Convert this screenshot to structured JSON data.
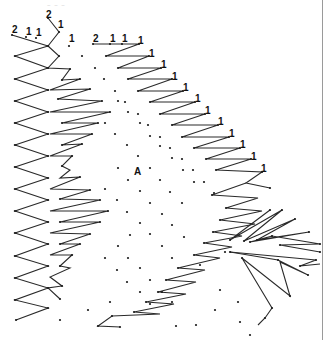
{
  "diagram": {
    "type": "lace-pricking",
    "faint_header": "~ ~ ~",
    "center_label": "A",
    "colors": {
      "line": "#2a2a2a",
      "dot": "#1a1a1a",
      "label": "#111111",
      "border": "#9a9a9a"
    },
    "labels": [
      {
        "text": "2",
        "x": 12,
        "y": 33
      },
      {
        "text": "1",
        "x": 26,
        "y": 35
      },
      {
        "text": "1",
        "x": 36,
        "y": 36
      },
      {
        "text": "2",
        "x": 46,
        "y": 18
      },
      {
        "text": "1",
        "x": 58,
        "y": 28
      },
      {
        "text": "1",
        "x": 69,
        "y": 42
      },
      {
        "text": "2",
        "x": 93,
        "y": 42
      },
      {
        "text": "1",
        "x": 110,
        "y": 42
      },
      {
        "text": "1",
        "x": 122,
        "y": 42
      },
      {
        "text": "1",
        "x": 138,
        "y": 44
      },
      {
        "text": "1",
        "x": 149,
        "y": 57
      },
      {
        "text": "1",
        "x": 161,
        "y": 68
      },
      {
        "text": "1",
        "x": 172,
        "y": 80
      },
      {
        "text": "1",
        "x": 183,
        "y": 91
      },
      {
        "text": "1",
        "x": 195,
        "y": 102
      },
      {
        "text": "1",
        "x": 205,
        "y": 114
      },
      {
        "text": "1",
        "x": 218,
        "y": 125
      },
      {
        "text": "1",
        "x": 229,
        "y": 137
      },
      {
        "text": "1",
        "x": 240,
        "y": 148
      },
      {
        "text": "1",
        "x": 251,
        "y": 160
      },
      {
        "text": "1",
        "x": 261,
        "y": 172
      }
    ],
    "polylines": [
      [
        [
          12,
          35
        ],
        [
          48,
          46
        ],
        [
          15,
          56
        ],
        [
          48,
          68
        ],
        [
          15,
          79
        ],
        [
          48,
          90
        ],
        [
          15,
          101
        ],
        [
          48,
          112
        ],
        [
          15,
          123
        ],
        [
          48,
          134
        ],
        [
          15,
          145
        ],
        [
          48,
          156
        ],
        [
          15,
          167
        ],
        [
          48,
          178
        ],
        [
          15,
          189
        ],
        [
          48,
          200
        ],
        [
          15,
          211
        ],
        [
          48,
          222
        ],
        [
          15,
          233
        ],
        [
          48,
          244
        ],
        [
          15,
          256
        ],
        [
          48,
          266
        ],
        [
          15,
          278
        ],
        [
          48,
          288
        ],
        [
          15,
          300
        ],
        [
          48,
          308
        ],
        [
          16,
          320
        ]
      ],
      [
        [
          48,
          46
        ],
        [
          59,
          32
        ],
        [
          48,
          18
        ]
      ],
      [
        [
          48,
          46
        ],
        [
          59,
          56
        ],
        [
          48,
          68
        ],
        [
          70,
          69
        ],
        [
          62,
          80
        ],
        [
          80,
          79
        ],
        [
          50,
          90
        ],
        [
          90,
          89
        ],
        [
          58,
          99
        ],
        [
          102,
          101
        ],
        [
          50,
          112
        ],
        [
          110,
          112
        ],
        [
          62,
          123
        ],
        [
          98,
          123
        ],
        [
          50,
          134
        ],
        [
          92,
          134
        ],
        [
          62,
          145
        ],
        [
          82,
          144
        ],
        [
          50,
          156
        ],
        [
          72,
          156
        ],
        [
          62,
          166
        ],
        [
          70,
          170
        ],
        [
          60,
          178
        ],
        [
          80,
          177
        ],
        [
          50,
          189
        ],
        [
          90,
          190
        ],
        [
          60,
          199
        ],
        [
          100,
          200
        ],
        [
          50,
          211
        ],
        [
          108,
          211
        ],
        [
          60,
          222
        ],
        [
          100,
          222
        ],
        [
          50,
          233
        ],
        [
          90,
          234
        ],
        [
          60,
          244
        ],
        [
          80,
          244
        ],
        [
          50,
          255
        ],
        [
          72,
          255
        ],
        [
          60,
          266
        ],
        [
          70,
          268
        ],
        [
          50,
          277
        ],
        [
          62,
          286
        ],
        [
          48,
          288
        ],
        [
          60,
          299
        ]
      ],
      [
        [
          93,
          44
        ],
        [
          139,
          44
        ],
        [
          106,
          56
        ],
        [
          149,
          56
        ],
        [
          118,
          68
        ],
        [
          161,
          68
        ],
        [
          128,
          79
        ],
        [
          172,
          79
        ],
        [
          138,
          91
        ],
        [
          183,
          91
        ],
        [
          150,
          102
        ],
        [
          195,
          102
        ],
        [
          160,
          114
        ],
        [
          205,
          114
        ],
        [
          172,
          125
        ],
        [
          218,
          125
        ],
        [
          182,
          137
        ],
        [
          229,
          137
        ],
        [
          194,
          148
        ],
        [
          240,
          148
        ],
        [
          206,
          159
        ],
        [
          251,
          159
        ],
        [
          216,
          170
        ],
        [
          262,
          172
        ],
        [
          246,
          183
        ],
        [
          270,
          188
        ]
      ],
      [
        [
          246,
          183
        ],
        [
          212,
          195
        ],
        [
          258,
          198
        ],
        [
          226,
          208
        ],
        [
          262,
          211
        ],
        [
          220,
          220
        ],
        [
          255,
          224
        ],
        [
          213,
          232
        ],
        [
          242,
          236
        ],
        [
          204,
          243
        ],
        [
          232,
          247
        ],
        [
          194,
          255
        ],
        [
          220,
          258
        ],
        [
          178,
          268
        ],
        [
          205,
          270
        ],
        [
          166,
          280
        ],
        [
          196,
          282
        ],
        [
          158,
          292
        ],
        [
          186,
          294
        ],
        [
          146,
          302
        ],
        [
          174,
          304
        ],
        [
          134,
          312
        ],
        [
          160,
          314
        ],
        [
          112,
          316
        ],
        [
          98,
          326
        ],
        [
          120,
          327
        ]
      ],
      [
        [
          270,
          210
        ],
        [
          230,
          240
        ],
        [
          282,
          210
        ],
        [
          244,
          241
        ],
        [
          295,
          219
        ],
        [
          257,
          240
        ],
        [
          309,
          232
        ],
        [
          250,
          242
        ],
        [
          272,
          236
        ],
        [
          320,
          244
        ],
        [
          280,
          245
        ],
        [
          320,
          252
        ]
      ],
      [
        [
          230,
          252
        ],
        [
          278,
          260
        ],
        [
          308,
          275
        ],
        [
          280,
          262
        ],
        [
          290,
          296
        ],
        [
          242,
          258
        ],
        [
          272,
          308
        ],
        [
          265,
          318
        ],
        [
          258,
          325
        ]
      ],
      [
        [
          230,
          252
        ],
        [
          316,
          260
        ],
        [
          300,
          266
        ],
        [
          320,
          264
        ]
      ]
    ],
    "dots": [
      [
        12,
        35
      ],
      [
        26,
        37
      ],
      [
        36,
        38
      ],
      [
        48,
        18
      ],
      [
        59,
        32
      ],
      [
        69,
        46
      ],
      [
        48,
        46
      ],
      [
        15,
        56
      ],
      [
        48,
        68
      ],
      [
        15,
        79
      ],
      [
        48,
        90
      ],
      [
        15,
        101
      ],
      [
        48,
        112
      ],
      [
        15,
        123
      ],
      [
        48,
        134
      ],
      [
        15,
        145
      ],
      [
        48,
        156
      ],
      [
        15,
        167
      ],
      [
        48,
        178
      ],
      [
        15,
        189
      ],
      [
        48,
        200
      ],
      [
        15,
        211
      ],
      [
        48,
        222
      ],
      [
        15,
        233
      ],
      [
        48,
        244
      ],
      [
        15,
        256
      ],
      [
        48,
        266
      ],
      [
        15,
        278
      ],
      [
        48,
        288
      ],
      [
        15,
        300
      ],
      [
        48,
        308
      ],
      [
        16,
        320
      ],
      [
        60,
        320
      ],
      [
        59,
        56
      ],
      [
        70,
        69
      ],
      [
        62,
        80
      ],
      [
        80,
        79
      ],
      [
        90,
        89
      ],
      [
        58,
        99
      ],
      [
        102,
        101
      ],
      [
        110,
        112
      ],
      [
        62,
        123
      ],
      [
        98,
        123
      ],
      [
        92,
        134
      ],
      [
        62,
        145
      ],
      [
        82,
        144
      ],
      [
        72,
        156
      ],
      [
        62,
        166
      ],
      [
        80,
        177
      ],
      [
        90,
        190
      ],
      [
        60,
        199
      ],
      [
        100,
        200
      ],
      [
        108,
        211
      ],
      [
        60,
        222
      ],
      [
        100,
        222
      ],
      [
        90,
        234
      ],
      [
        60,
        244
      ],
      [
        80,
        244
      ],
      [
        72,
        255
      ],
      [
        60,
        266
      ],
      [
        62,
        286
      ],
      [
        60,
        299
      ],
      [
        93,
        44
      ],
      [
        110,
        44
      ],
      [
        122,
        44
      ],
      [
        139,
        44
      ],
      [
        106,
        56
      ],
      [
        149,
        56
      ],
      [
        118,
        68
      ],
      [
        161,
        68
      ],
      [
        128,
        79
      ],
      [
        172,
        79
      ],
      [
        138,
        91
      ],
      [
        183,
        91
      ],
      [
        150,
        102
      ],
      [
        195,
        102
      ],
      [
        160,
        114
      ],
      [
        205,
        114
      ],
      [
        172,
        125
      ],
      [
        218,
        125
      ],
      [
        182,
        137
      ],
      [
        229,
        137
      ],
      [
        194,
        148
      ],
      [
        240,
        148
      ],
      [
        206,
        159
      ],
      [
        251,
        159
      ],
      [
        216,
        170
      ],
      [
        262,
        172
      ],
      [
        270,
        188
      ],
      [
        82,
        56
      ],
      [
        95,
        68
      ],
      [
        104,
        79
      ],
      [
        115,
        91
      ],
      [
        125,
        102
      ],
      [
        138,
        114
      ],
      [
        148,
        125
      ],
      [
        160,
        137
      ],
      [
        170,
        148
      ],
      [
        182,
        159
      ],
      [
        193,
        170
      ],
      [
        204,
        182
      ],
      [
        214,
        193
      ],
      [
        118,
        101
      ],
      [
        128,
        112
      ],
      [
        140,
        123
      ],
      [
        150,
        136
      ],
      [
        160,
        146
      ],
      [
        172,
        158
      ],
      [
        183,
        170
      ],
      [
        194,
        182
      ],
      [
        105,
        123
      ],
      [
        115,
        134
      ],
      [
        127,
        145
      ],
      [
        138,
        156
      ],
      [
        150,
        168
      ],
      [
        160,
        180
      ],
      [
        170,
        192
      ],
      [
        182,
        203
      ],
      [
        118,
        168
      ],
      [
        128,
        180
      ],
      [
        140,
        191
      ],
      [
        150,
        203
      ],
      [
        162,
        214
      ],
      [
        172,
        225
      ],
      [
        184,
        237
      ],
      [
        105,
        189
      ],
      [
        117,
        200
      ],
      [
        127,
        212
      ],
      [
        140,
        223
      ],
      [
        150,
        234
      ],
      [
        162,
        246
      ],
      [
        172,
        258
      ],
      [
        130,
        235
      ],
      [
        118,
        246
      ],
      [
        128,
        258
      ],
      [
        140,
        268
      ],
      [
        150,
        280
      ],
      [
        162,
        292
      ],
      [
        172,
        302
      ],
      [
        105,
        258
      ],
      [
        117,
        270
      ],
      [
        127,
        282
      ],
      [
        140,
        292
      ],
      [
        150,
        304
      ],
      [
        110,
        302
      ],
      [
        88,
        310
      ],
      [
        98,
        326
      ],
      [
        120,
        327
      ],
      [
        212,
        195
      ],
      [
        226,
        208
      ],
      [
        220,
        220
      ],
      [
        213,
        232
      ],
      [
        204,
        243
      ],
      [
        194,
        255
      ],
      [
        178,
        268
      ],
      [
        166,
        280
      ],
      [
        158,
        292
      ],
      [
        146,
        302
      ],
      [
        134,
        312
      ],
      [
        112,
        316
      ],
      [
        270,
        210
      ],
      [
        282,
        210
      ],
      [
        295,
        219
      ],
      [
        309,
        232
      ],
      [
        320,
        244
      ],
      [
        230,
        240
      ],
      [
        244,
        241
      ],
      [
        257,
        240
      ],
      [
        272,
        236
      ],
      [
        250,
        242
      ],
      [
        280,
        245
      ],
      [
        320,
        252
      ],
      [
        225,
        252
      ],
      [
        230,
        252
      ],
      [
        242,
        258
      ],
      [
        278,
        260
      ],
      [
        300,
        266
      ],
      [
        316,
        260
      ],
      [
        308,
        275
      ],
      [
        290,
        296
      ],
      [
        272,
        308
      ],
      [
        265,
        318
      ],
      [
        200,
        265
      ],
      [
        220,
        290
      ],
      [
        238,
        302
      ],
      [
        215,
        310
      ],
      [
        196,
        325
      ],
      [
        176,
        326
      ],
      [
        240,
        322
      ],
      [
        250,
        335
      ]
    ]
  }
}
